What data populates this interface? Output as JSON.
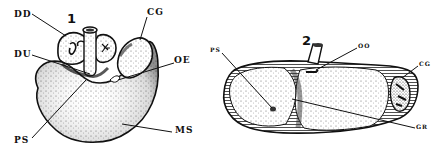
{
  "figure": {
    "panels": [
      {
        "number": "1",
        "labels": {
          "dd": "DD",
          "du": "DU",
          "cg": "CG",
          "oe": "OE",
          "ps": "PS",
          "ms": "MS"
        }
      },
      {
        "number": "2",
        "labels": {
          "ps": "PS",
          "oo": "OO",
          "cg": "CG",
          "gr": "GR"
        }
      }
    ]
  }
}
